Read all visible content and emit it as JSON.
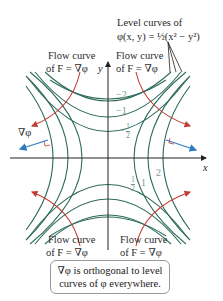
{
  "title_annotation": {
    "line1": "Level curves of",
    "line2": "φ(x, y) = ½(x² − y²)"
  },
  "flow_labels": {
    "top_left": {
      "line1": "Flow curve",
      "line2": "of F = ∇φ"
    },
    "top_right": {
      "line1": "Flow curve",
      "line2": "of F = ∇φ"
    },
    "bottom_left": {
      "line1": "Flow curve",
      "line2": "of F = ∇φ"
    },
    "bottom_right": {
      "line1": "Flow curve",
      "line2": "of F = ∇φ"
    }
  },
  "axes": {
    "x_label": "x",
    "y_label": "y"
  },
  "gradient_label": "∇φ",
  "level_values_top": [
    "−2",
    "−1",
    "−½"
  ],
  "level_values_right": [
    "½",
    "1",
    "2"
  ],
  "level_top": {
    "v1": "−2",
    "v2": "−1",
    "v3_num": "1",
    "v3_den": "2",
    "v3_sign": "−"
  },
  "level_right": {
    "v1_num": "1",
    "v1_den": "2",
    "v2": "1",
    "v3": "2"
  },
  "note": {
    "line1": "∇φ is orthogonal to level",
    "line2": "curves of φ everywhere."
  },
  "colors": {
    "level_curve": "#2f6b5c",
    "flow_curve": "#c23b32",
    "gradient_arrow": "#2e7cc0",
    "axis": "#222222",
    "value_label": "#7a9a8e"
  }
}
